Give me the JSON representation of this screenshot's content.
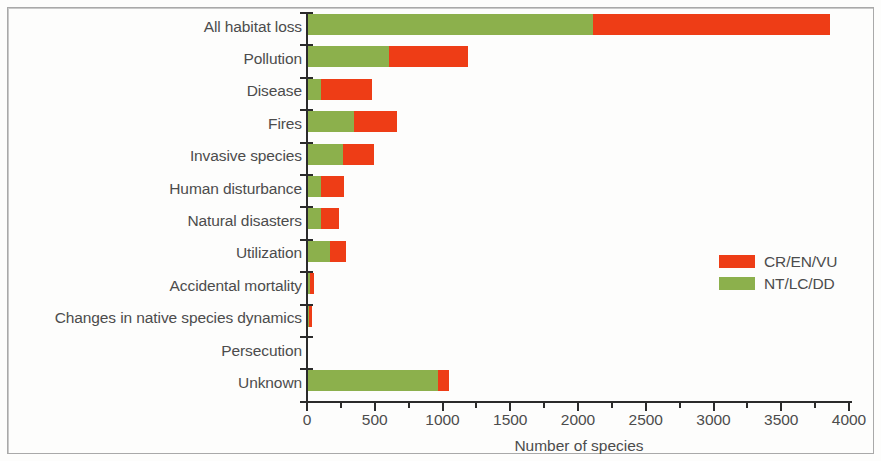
{
  "chart_data": {
    "type": "bar",
    "orientation": "horizontal",
    "stacked": true,
    "title": "",
    "xlabel": "Number of species",
    "ylabel": "",
    "xlim": [
      0,
      4000
    ],
    "xticks": [
      0,
      500,
      1000,
      1500,
      2000,
      2500,
      3000,
      3500,
      4000
    ],
    "xtick_labels": [
      "0",
      "500",
      "1000",
      "1500",
      "2000",
      "2500",
      "3000",
      "3500",
      "4000"
    ],
    "minor_tick_step": 250,
    "grid": false,
    "legend_position": "right",
    "categories": [
      "All habitat loss",
      "Pollution",
      "Disease",
      "Fires",
      "Invasive species",
      "Human disturbance",
      "Natural disasters",
      "Utilization",
      "Accidental mortality",
      "Changes in native species dynamics",
      "Persecution",
      "Unknown"
    ],
    "series": [
      {
        "name": "NT/LC/DD",
        "color": "#8cb04c",
        "values": [
          2100,
          600,
          95,
          340,
          260,
          95,
          95,
          160,
          15,
          8,
          0,
          960
        ]
      },
      {
        "name": "CR/EN/VU",
        "color": "#ee3d16",
        "values": [
          1750,
          580,
          380,
          320,
          230,
          170,
          135,
          120,
          30,
          22,
          0,
          80
        ]
      }
    ],
    "totals": [
      3850,
      1180,
      475,
      660,
      490,
      265,
      230,
      280,
      45,
      30,
      0,
      1040
    ]
  },
  "legend": {
    "items": [
      {
        "label": "CR/EN/VU",
        "color": "#ee3d16"
      },
      {
        "label": "NT/LC/DD",
        "color": "#8cb04c"
      }
    ]
  },
  "axis": {
    "x_title": "Number of species"
  },
  "colors": {
    "red": "#ee3d16",
    "green": "#8cb04c",
    "axis": "#2b2b2b",
    "text": "#4c4c4c",
    "background": "#fdfdfc"
  }
}
